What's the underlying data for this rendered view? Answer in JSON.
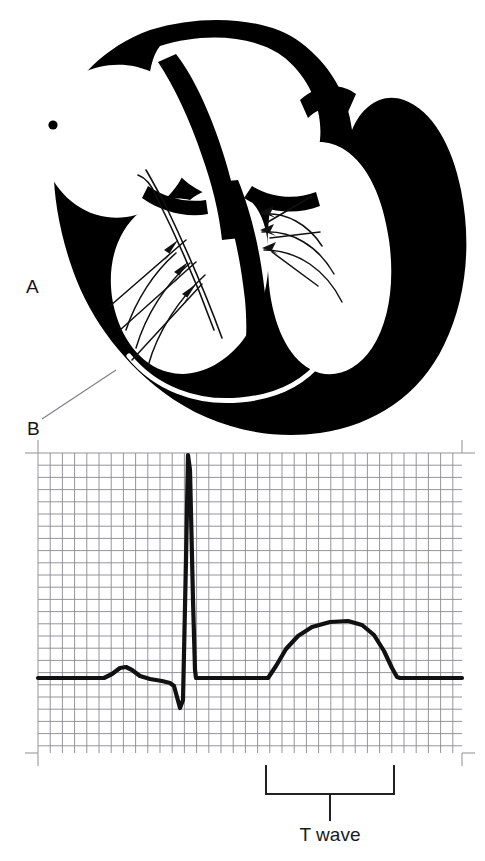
{
  "figure": {
    "type": "medical-illustration",
    "background_color": "#ffffff",
    "ink_color": "#000000"
  },
  "heart_diagram": {
    "name": "heart-cross-section",
    "labels": [
      {
        "id": "A",
        "text": "A",
        "x": 28,
        "y": 288
      },
      {
        "id": "B",
        "text": "B",
        "x": 30,
        "y": 430
      }
    ],
    "leader_line": {
      "from_x": 42,
      "from_y": 419,
      "to_x": 116,
      "to_y": 370
    },
    "sa_node_marker": {
      "cx": 53,
      "cy": 125,
      "r": 4.5
    },
    "features": [
      "right atrium",
      "left atrium",
      "interatrial septum",
      "atrioventricular node",
      "bundle of His",
      "left bundle branch",
      "right bundle branch",
      "purkinje fibers",
      "left ventricle wall",
      "right ventricle wall",
      "papillary muscles"
    ],
    "conduction_arrows": {
      "left_fan_count": 3,
      "right_fan_count": 3
    }
  },
  "ecg": {
    "name": "ecg-tracing",
    "grid": {
      "x0": 38,
      "y0": 453,
      "x1": 462,
      "y1": 753,
      "cell_px": 12.2,
      "line_color": "#8a8a90",
      "tick_color": "#9a9aa0",
      "corner_tick_len": 13
    },
    "baseline_y": 678,
    "trace_color": "#111111",
    "trace_width": 4.2,
    "annotation": {
      "bracket": {
        "name": "t-wave-bracket",
        "left_x": 266,
        "right_x": 394,
        "top_y": 766,
        "bottom_y": 794,
        "stem_x": 330,
        "stem_bottom_y": 820
      },
      "label": "T wave"
    }
  },
  "chart_data": {
    "type": "line",
    "title": "",
    "xlabel": "",
    "ylabel": "",
    "grid": true,
    "legend": null,
    "annotations": [
      {
        "text": "T wave",
        "x_start": 266,
        "x_end": 394,
        "kind": "bracket"
      }
    ],
    "series": [
      {
        "name": "ECG waveform",
        "points": [
          [
            38,
            678
          ],
          [
            104,
            678
          ],
          [
            112,
            674
          ],
          [
            120,
            668
          ],
          [
            126,
            667
          ],
          [
            132,
            670
          ],
          [
            140,
            676
          ],
          [
            150,
            679
          ],
          [
            162,
            681
          ],
          [
            170,
            683
          ],
          [
            174,
            686
          ],
          [
            177,
            697
          ],
          [
            180,
            708
          ],
          [
            183,
            700
          ],
          [
            186,
            560
          ],
          [
            188,
            455
          ],
          [
            190,
            470
          ],
          [
            193,
            600
          ],
          [
            195,
            670
          ],
          [
            196,
            678
          ],
          [
            268,
            678
          ],
          [
            276,
            666
          ],
          [
            286,
            649
          ],
          [
            298,
            636
          ],
          [
            312,
            627
          ],
          [
            330,
            622
          ],
          [
            348,
            621
          ],
          [
            362,
            625
          ],
          [
            374,
            635
          ],
          [
            384,
            651
          ],
          [
            392,
            668
          ],
          [
            397,
            677
          ],
          [
            400,
            678
          ],
          [
            462,
            678
          ]
        ]
      }
    ],
    "waveform_components": [
      {
        "name": "P wave",
        "start_x": 104,
        "peak_x": 126,
        "end_x": 150,
        "amplitude_px": 11,
        "direction": "positive"
      },
      {
        "name": "Q wave",
        "start_x": 174,
        "trough_x": 180,
        "end_x": 183,
        "amplitude_px": 30,
        "direction": "negative"
      },
      {
        "name": "R wave",
        "start_x": 183,
        "peak_x": 188,
        "end_x": 193,
        "amplitude_px": 223,
        "direction": "positive"
      },
      {
        "name": "S wave",
        "start_x": 193,
        "trough_x": 195,
        "end_x": 196,
        "amplitude_px": 0,
        "direction": "negative"
      },
      {
        "name": "ST segment",
        "start_x": 196,
        "end_x": 268,
        "amplitude_px": 0,
        "direction": "flat"
      },
      {
        "name": "T wave",
        "start_x": 268,
        "peak_x": 348,
        "end_x": 400,
        "amplitude_px": 57,
        "direction": "positive"
      }
    ]
  }
}
